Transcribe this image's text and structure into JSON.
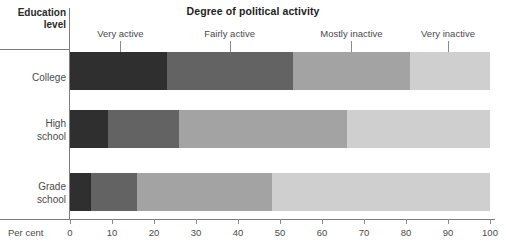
{
  "chart_data": {
    "type": "bar",
    "subtype": "stacked-horizontal-100",
    "title": "Degree of political activity",
    "xlabel": "Per cent",
    "ylabel": "Education level",
    "categories": [
      "College",
      "High school",
      "Grade school"
    ],
    "legend": [
      "Very active",
      "Fairly active",
      "Mostly inactive",
      "Very inactive"
    ],
    "legend_position": "top",
    "grid": false,
    "xlim": [
      0,
      100
    ],
    "xticks": [
      0,
      10,
      20,
      30,
      40,
      50,
      60,
      70,
      80,
      90,
      100
    ],
    "xtick_labels": [
      "0",
      "10",
      "20",
      "30",
      "40",
      "50",
      "60",
      "70",
      "80",
      "90",
      "100"
    ],
    "series": [
      {
        "name": "Very active",
        "values": [
          23,
          9,
          5
        ]
      },
      {
        "name": "Fairly active",
        "values": [
          30,
          17,
          11
        ]
      },
      {
        "name": "Mostly inactive",
        "values": [
          28,
          40,
          32
        ]
      },
      {
        "name": "Very inactive",
        "values": [
          19,
          34,
          52
        ]
      }
    ],
    "colors": [
      "#2f2f2f",
      "#636363",
      "#a3a3a3",
      "#cfcfcf"
    ],
    "annotations": [
      {
        "text": "Very active",
        "x": 12
      },
      {
        "text": "Fairly active",
        "x": 38
      },
      {
        "text": "Mostly inactive",
        "x": 67
      },
      {
        "text": "Very inactive",
        "x": 90
      }
    ]
  },
  "titles": {
    "main": "Degree of political activity",
    "axis": "Education level",
    "axis_line1": "Education",
    "axis_line2": "level"
  },
  "rows": [
    {
      "label_line1": "College",
      "label_line2": ""
    },
    {
      "label_line1": "High",
      "label_line2": "school"
    },
    {
      "label_line1": "Grade",
      "label_line2": "school"
    }
  ],
  "xaxis": {
    "caption": "Per cent",
    "labels": [
      "0",
      "10",
      "20",
      "30",
      "40",
      "50",
      "60",
      "70",
      "80",
      "90",
      "100"
    ]
  },
  "legend_labels": [
    "Very active",
    "Fairly active",
    "Mostly inactive",
    "Very inactive"
  ],
  "colors": {
    "very_active": "#2f2f2f",
    "fairly_active": "#636363",
    "mostly_inactive": "#a3a3a3",
    "very_inactive": "#cfcfcf",
    "rule": "#7c7c7c",
    "text": "#4a4a4a",
    "title_text": "#1d1d1d"
  }
}
